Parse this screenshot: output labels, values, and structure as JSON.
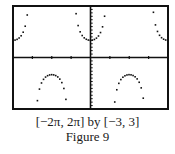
{
  "chart_data": {
    "type": "scatter",
    "title": "",
    "function": "y = sec(x)",
    "xlabel": "",
    "ylabel": "",
    "xlim": [
      -6.2832,
      6.2832
    ],
    "ylim": [
      -3,
      3
    ],
    "xscale": 1.5708,
    "yscale": 0.2,
    "grid": false,
    "legend": "none",
    "asymptotes_x": [
      -4.7124,
      -1.5708,
      1.5708,
      4.7124
    ],
    "series": [
      {
        "name": "sec(x)",
        "style": "dots",
        "sample_step": 0.165,
        "branches": [
          {
            "x_range": [
              -6.2832,
              -4.85
            ],
            "shape": "upward, min y=1 at x=-2π"
          },
          {
            "x_range": [
              -4.55,
              -1.72
            ],
            "shape": "downward, max y=-1 at x=-π"
          },
          {
            "x_range": [
              -1.22,
              1.22
            ],
            "shape": "upward, min y=1 at x=0"
          },
          {
            "x_range": [
              1.72,
              4.55
            ],
            "shape": "downward, max y=-1 at x=π"
          },
          {
            "x_range": [
              4.85,
              6.2832
            ],
            "shape": "upward, min y=1 at x=2π"
          }
        ]
      }
    ],
    "frame": {
      "left": 13,
      "top": 6,
      "right": 168,
      "bottom": 109
    },
    "colors": {
      "ink": "#111111",
      "background": "#ffffff"
    }
  },
  "caption": {
    "window": "[−2π, 2π] by [−3, 3]",
    "figure": "Figure 9"
  }
}
